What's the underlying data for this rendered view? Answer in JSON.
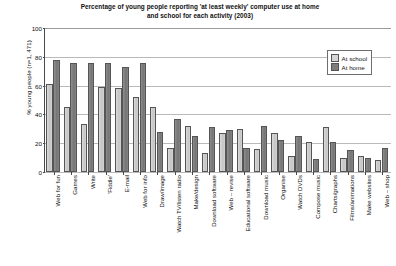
{
  "chart_data": {
    "type": "bar",
    "title": "Percentage of young people reporting 'at least weekly' computer use at home and school for each activity (2003)",
    "title_lines": [
      "Percentage of young people reporting 'at least weekly' computer use at home",
      "and school for each activity (2003)"
    ],
    "xlabel": "",
    "ylabel": "% young people (n=1, 471)",
    "ylim": [
      0,
      100
    ],
    "ytick_values": [
      0,
      20,
      40,
      60,
      80,
      100
    ],
    "ytick_labels": [
      "0",
      "20",
      "40",
      "60",
      "80",
      "100"
    ],
    "grid": true,
    "legend_position": "top-right",
    "categories": [
      "Web for fun",
      "Games",
      "Write",
      "'Fiddle'",
      "E-mail",
      "Web for info",
      "Draw/image",
      "Watch TV/listen radio",
      "Make/design",
      "Download software",
      "Web – revise",
      "Educational software",
      "Download music",
      "Organise",
      "Watch DVDs",
      "Compose music",
      "Charts/graphs",
      "Films/animations",
      "Make websites",
      "Web – shop"
    ],
    "series": [
      {
        "name": "At school",
        "color": "#c9c9c9",
        "values": [
          61,
          45,
          33,
          59,
          58,
          52,
          45,
          17,
          32,
          13,
          27,
          30,
          16,
          27,
          11,
          21,
          31,
          10,
          11,
          8
        ]
      },
      {
        "name": "At home",
        "color": "#7d7d7d",
        "values": [
          78,
          76,
          76,
          76,
          73,
          76,
          28,
          37,
          25,
          31,
          29,
          17,
          32,
          22,
          25,
          9,
          21,
          15,
          10,
          17
        ]
      }
    ]
  },
  "legend": {
    "items": [
      {
        "label": "At school"
      },
      {
        "label": "At home"
      }
    ]
  }
}
